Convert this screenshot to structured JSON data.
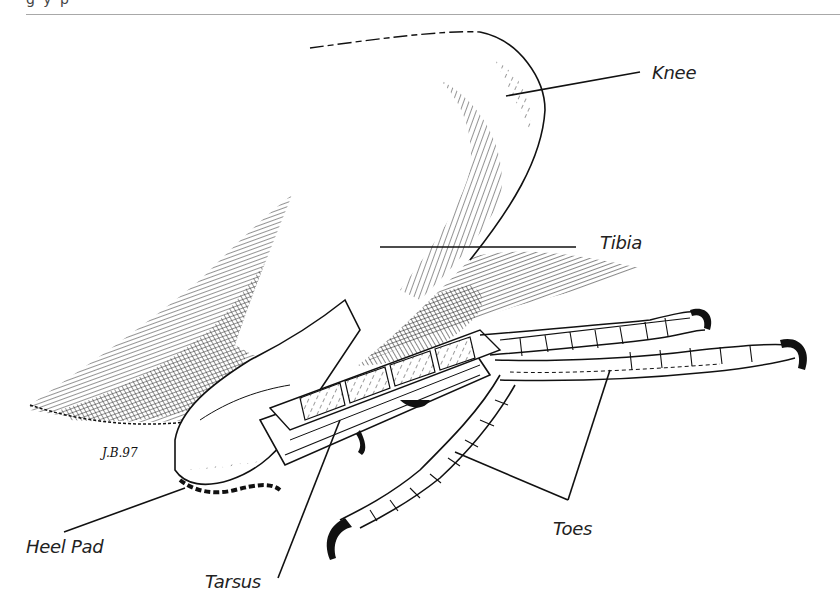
{
  "header": {
    "fragment": "g y p",
    "rule_color": "#a8a8a8"
  },
  "figure": {
    "signature": "J.B.97",
    "ink_color": "#111111",
    "labels": [
      {
        "id": "knee",
        "text": "Knee"
      },
      {
        "id": "tibia",
        "text": "Tibia"
      },
      {
        "id": "heel_pad",
        "text": "Heel Pad"
      },
      {
        "id": "tarsus",
        "text": "Tarsus"
      },
      {
        "id": "toes",
        "text": "Toes"
      }
    ]
  }
}
